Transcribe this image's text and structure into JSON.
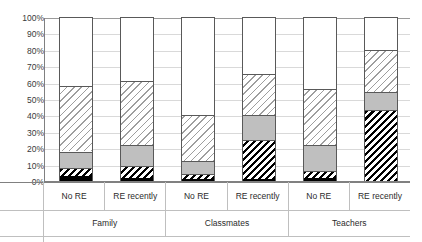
{
  "chart_data": {
    "type": "bar",
    "stacked": true,
    "stack_total": 100,
    "title": "",
    "subtitle": "",
    "xlabel": "",
    "ylabel": "",
    "ylim": [
      0,
      100
    ],
    "y_tick_labels": [
      "100%",
      "90%",
      "80%",
      "70%",
      "60%",
      "50%",
      "40%",
      "30%",
      "20%",
      "10%",
      "0%"
    ],
    "y_tick_values": [
      100,
      90,
      80,
      70,
      60,
      50,
      40,
      30,
      20,
      10,
      0
    ],
    "grid": true,
    "legend": "none",
    "group_labels": [
      "Family",
      "Classmates",
      "Teachers"
    ],
    "categories": [
      "No RE",
      "RE recently",
      "No RE",
      "RE recently",
      "No RE",
      "RE recently"
    ],
    "series": [
      {
        "name": "series-1-black",
        "fill": "solid-black",
        "color": "#000000",
        "values": [
          3,
          2,
          1,
          1,
          2,
          0
        ]
      },
      {
        "name": "series-2-hatch-dark",
        "fill": "diagonal-hatch-dark",
        "color": "#000000",
        "values": [
          5,
          7,
          3,
          24,
          4,
          43
        ]
      },
      {
        "name": "series-3-gray",
        "fill": "solid-gray",
        "color": "#BFBFBF",
        "values": [
          10,
          13,
          8,
          15,
          16,
          11
        ]
      },
      {
        "name": "series-4-hatch-light",
        "fill": "diagonal-hatch-light",
        "color": "#9E9E9E",
        "values": [
          40,
          39,
          28,
          25,
          34,
          26
        ]
      },
      {
        "name": "series-5-white",
        "fill": "solid-white",
        "color": "#FFFFFF",
        "values": [
          42,
          39,
          60,
          35,
          44,
          20
        ]
      }
    ],
    "bar_tops_percent": [
      58,
      61,
      40,
      65,
      56,
      80
    ]
  },
  "axis": {
    "y_ticks": [
      "100%",
      "90%",
      "80%",
      "70%",
      "60%",
      "50%",
      "40%",
      "30%",
      "20%",
      "10%",
      "0%"
    ]
  },
  "x_axis": {
    "cells": [
      "No RE",
      "RE recently",
      "No RE",
      "RE recently",
      "No RE",
      "RE recently"
    ],
    "groups": [
      "Family",
      "Classmates",
      "Teachers"
    ]
  },
  "colors": {
    "black": "#000000",
    "gray": "#BFBFBF",
    "white": "#FFFFFF",
    "hatch_dark": "#000000",
    "hatch_light": "#9E9E9E",
    "gridline": "#D9D9D9",
    "axis": "#808080",
    "bar_outline": "#595959",
    "text": "#2B2B2B"
  }
}
